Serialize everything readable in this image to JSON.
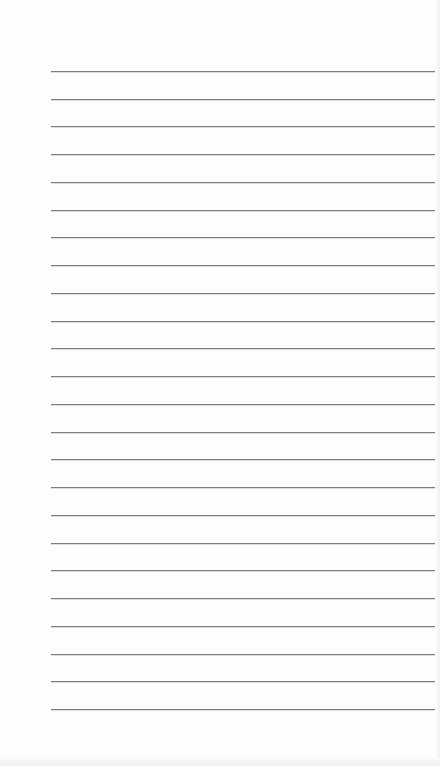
{
  "document": {
    "type": "lined-paper",
    "line_count": 24,
    "first_line_y": 71,
    "line_spacing": 27.74,
    "line_left": 51,
    "line_right": 435,
    "line_color": "#7d7d7d",
    "paper_color": "#fdfdfd"
  }
}
